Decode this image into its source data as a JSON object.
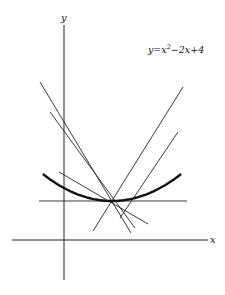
{
  "chart_data": {
    "type": "line",
    "title": "",
    "xlabel": "x",
    "ylabel": "y",
    "grid": false,
    "legend": "none",
    "annotation": "y=x²−2x+4",
    "series": [
      {
        "name": "y=x^2-2x+4",
        "kind": "curve",
        "equation": "y = x^2 - 2x + 4",
        "vertex": [
          1,
          3
        ],
        "x_range": [
          -0.44,
          2.44
        ]
      },
      {
        "name": "tangent-horizontal",
        "kind": "line",
        "points": [
          [
            -0.52,
            3
          ],
          [
            2.56,
            3
          ]
        ]
      },
      {
        "name": "tangent-1",
        "kind": "line",
        "points": [
          [
            -0.5,
            12.2
          ],
          [
            1.4,
            0.5
          ]
        ]
      },
      {
        "name": "tangent-2",
        "kind": "line",
        "points": [
          [
            2.48,
            11.8
          ],
          [
            0.6,
            0.7
          ]
        ]
      },
      {
        "name": "tangent-3",
        "kind": "line",
        "points": [
          [
            -0.29,
            9.8
          ],
          [
            1.48,
            0.9
          ]
        ]
      },
      {
        "name": "tangent-4",
        "kind": "line",
        "points": [
          [
            2.38,
            8.3
          ],
          [
            1.17,
            1.7
          ]
        ]
      },
      {
        "name": "tangent-5",
        "kind": "line",
        "points": [
          [
            -0.1,
            5.2
          ],
          [
            1.75,
            1.2
          ]
        ]
      }
    ]
  },
  "labels": {
    "y_axis": "y",
    "x_axis": "x",
    "curve_prefix": "y=x",
    "curve_exp": "2",
    "curve_suffix": "−2x+4"
  }
}
